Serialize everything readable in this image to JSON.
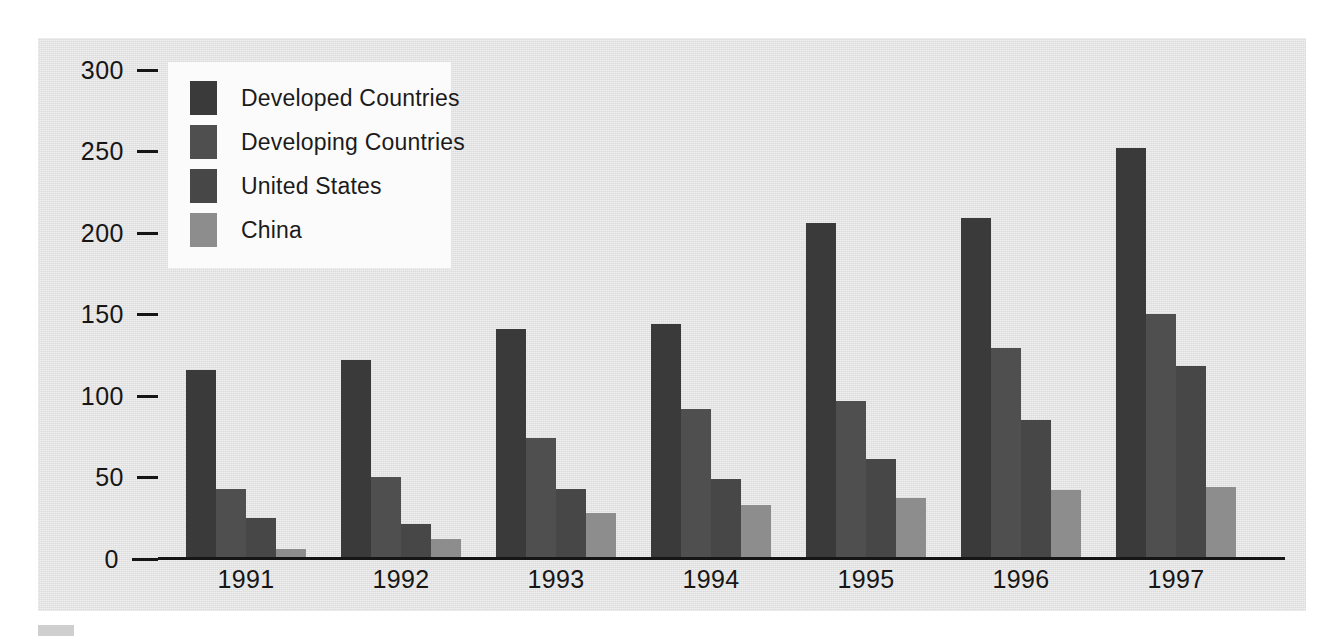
{
  "chart_data": {
    "type": "bar",
    "title": "",
    "subtitle": "",
    "xlabel": "",
    "ylabel": "",
    "categories": [
      "1991",
      "1992",
      "1993",
      "1994",
      "1995",
      "1996",
      "1997"
    ],
    "series": [
      {
        "name": "Developed Countries",
        "color": "#3a3a3a",
        "values": [
          115,
          121,
          140,
          143,
          205,
          208,
          251
        ]
      },
      {
        "name": "Developing Countries",
        "color": "#4f4f4f",
        "values": [
          42,
          49,
          73,
          91,
          96,
          128,
          149
        ]
      },
      {
        "name": "United States",
        "color": "#474747",
        "values": [
          24,
          20,
          42,
          48,
          60,
          84,
          117
        ]
      },
      {
        "name": "China",
        "color": "#8d8d8d",
        "values": [
          5,
          11,
          27,
          32,
          36,
          41,
          43
        ]
      }
    ],
    "ylim": [
      0,
      300
    ],
    "yticks": [
      0,
      50,
      100,
      150,
      200,
      250,
      300
    ],
    "ytick_labels": [
      "0",
      "50",
      "100",
      "150",
      "200",
      "250",
      "300"
    ],
    "grid": false,
    "legend_position": "upper-left",
    "legend_entries": [
      "Developed Countries",
      "Developing Countries",
      "United States",
      "China"
    ],
    "annotations": []
  },
  "colors": {
    "panel_background": "#e2e2e2",
    "page_background": "#ffffff",
    "axis": "#161616",
    "legend_background": "#fbfbfb",
    "text": "#161616"
  }
}
